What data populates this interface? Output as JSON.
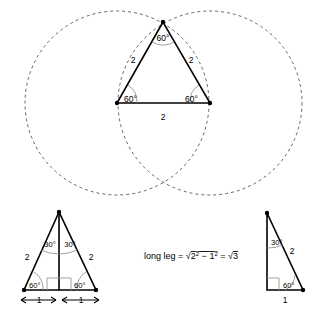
{
  "figure": {
    "colors": {
      "stroke": "#000000",
      "dashed_circle": "#555555",
      "angle_arc": "#888888",
      "right_angle_mark": "#999999",
      "background": "#ffffff"
    }
  },
  "top_figure": {
    "name": "equilateral-triangle-with-circles",
    "apex_angle": "60°",
    "left_base_angle": "60°",
    "right_base_angle": "60°",
    "left_side_label": "2",
    "right_side_label": "2",
    "base_label": "2",
    "circles": [
      {
        "name": "left-circle",
        "radius_label": "2"
      },
      {
        "name": "right-circle",
        "radius_label": "2"
      }
    ]
  },
  "bottom_left_figure": {
    "name": "bisected-equilateral-triangle",
    "left_half_apex_angle": "30°",
    "right_half_apex_angle": "30°",
    "left_base_angle": "60°",
    "right_base_angle": "60°",
    "left_side_label": "2",
    "right_side_label": "2",
    "left_base_segment_label": "1",
    "right_base_segment_label": "1",
    "right_angle_marks": 2
  },
  "formula": {
    "name": "long-leg-formula",
    "lead": "long leg = ",
    "radical_open": "√",
    "term_a_base": "2",
    "term_a_exp": "2",
    "minus": " − ",
    "term_b_base": "1",
    "term_b_exp": "2",
    "equals": " = ",
    "result_radical": "√",
    "result_value": "3",
    "plain_text": "long leg = √(2² − 1²) = √3"
  },
  "bottom_right_figure": {
    "name": "thirty-sixty-ninety-triangle",
    "top_angle": "30°",
    "bottom_right_angle": "60°",
    "hypotenuse_label": "2",
    "base_label": "1",
    "long_leg_label": "√3",
    "has_right_angle_mark": true
  }
}
